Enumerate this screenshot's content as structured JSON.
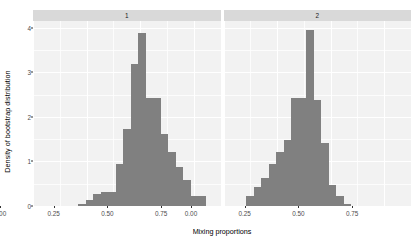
{
  "chart_data": {
    "type": "bar",
    "title": "",
    "subtitle": "",
    "xlabel": "Mixing proportions",
    "ylabel": "Density of bootstrap distribution",
    "grid": true,
    "legend": "none",
    "xlim": [
      0.0,
      0.875
    ],
    "ylim": [
      0.0,
      4.15
    ],
    "xticks": [
      {
        "value": 0.0,
        "label": "0.00"
      },
      {
        "value": 0.25,
        "label": "0.25"
      },
      {
        "value": 0.5,
        "label": "0.50"
      },
      {
        "value": 0.75,
        "label": "0.75"
      }
    ],
    "yticks": [
      {
        "value": 0,
        "label": "0"
      },
      {
        "value": 1,
        "label": "1"
      },
      {
        "value": 2,
        "label": "2"
      },
      {
        "value": 3,
        "label": "3"
      },
      {
        "value": 4,
        "label": "4"
      }
    ],
    "bin_width": 0.035,
    "panels": [
      {
        "strip_label": "1",
        "name": "panel-1",
        "bars": [
          {
            "x": 0.2275,
            "height": 0.05
          },
          {
            "x": 0.2625,
            "height": 0.13
          },
          {
            "x": 0.2975,
            "height": 0.28
          },
          {
            "x": 0.3325,
            "height": 0.32
          },
          {
            "x": 0.3675,
            "height": 0.32
          },
          {
            "x": 0.4025,
            "height": 0.95
          },
          {
            "x": 0.4375,
            "height": 1.72
          },
          {
            "x": 0.4725,
            "height": 3.18
          },
          {
            "x": 0.5075,
            "height": 3.88
          },
          {
            "x": 0.5425,
            "height": 2.42
          },
          {
            "x": 0.5775,
            "height": 2.42
          },
          {
            "x": 0.6125,
            "height": 1.62
          },
          {
            "x": 0.6475,
            "height": 1.22
          },
          {
            "x": 0.6825,
            "height": 0.88
          },
          {
            "x": 0.7175,
            "height": 0.58
          },
          {
            "x": 0.7525,
            "height": 0.22
          },
          {
            "x": 0.7875,
            "height": 0.22
          }
        ]
      },
      {
        "strip_label": "2",
        "name": "panel-2",
        "bars": [
          {
            "x": 0.1225,
            "height": 0.22
          },
          {
            "x": 0.1575,
            "height": 0.42
          },
          {
            "x": 0.1925,
            "height": 0.62
          },
          {
            "x": 0.2275,
            "height": 0.95
          },
          {
            "x": 0.2625,
            "height": 1.22
          },
          {
            "x": 0.2975,
            "height": 1.48
          },
          {
            "x": 0.3325,
            "height": 2.42
          },
          {
            "x": 0.3675,
            "height": 2.42
          },
          {
            "x": 0.4025,
            "height": 3.95
          },
          {
            "x": 0.4375,
            "height": 2.38
          },
          {
            "x": 0.4725,
            "height": 1.42
          },
          {
            "x": 0.5075,
            "height": 0.48
          },
          {
            "x": 0.5425,
            "height": 0.22
          },
          {
            "x": 0.5775,
            "height": 0.04
          }
        ]
      }
    ]
  }
}
